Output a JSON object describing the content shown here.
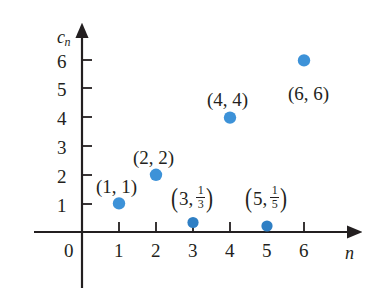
{
  "chart_data": {
    "type": "scatter",
    "title": "",
    "xlabel": "n",
    "ylabel": "c_n",
    "xlim": [
      0,
      6.6
    ],
    "ylim": [
      0,
      6.6
    ],
    "grid": false,
    "legend": null,
    "x": [
      1,
      2,
      3,
      4,
      5,
      6
    ],
    "y": [
      1,
      2,
      0.3333,
      4,
      0.2,
      6
    ],
    "point_labels": [
      "(1, 1)",
      "(2, 2)",
      "(3, 1/3)",
      "(4, 4)",
      "(5, 1/5)",
      "(6, 6)"
    ],
    "xticks": [
      0,
      1,
      2,
      3,
      4,
      5,
      6
    ],
    "yticks": [
      1,
      2,
      3,
      4,
      5,
      6
    ],
    "series": [
      {
        "name": "c_n",
        "points": [
          {
            "x": 1,
            "y": 1,
            "label": "(1, 1)",
            "kind": "plain"
          },
          {
            "x": 2,
            "y": 2,
            "label": "(2, 2)",
            "kind": "plain"
          },
          {
            "x": 3,
            "y": 0.3333,
            "label": "(3, 1/3)",
            "kind": "fraction",
            "whole": "3",
            "num": "1",
            "den": "3"
          },
          {
            "x": 4,
            "y": 4,
            "label": "(4, 4)",
            "kind": "plain"
          },
          {
            "x": 5,
            "y": 0.2,
            "label": "(5, 1/5)",
            "kind": "fraction",
            "whole": "5",
            "num": "1",
            "den": "5"
          },
          {
            "x": 6,
            "y": 6,
            "label": "(6, 6)",
            "kind": "plain"
          }
        ]
      }
    ]
  },
  "axes": {
    "y_label_base": "c",
    "y_label_sub": "n",
    "x_label": "n",
    "origin_label": "0",
    "y_ticks": [
      "6",
      "5",
      "4",
      "3",
      "2",
      "1"
    ],
    "x_ticks": [
      "1",
      "2",
      "3",
      "4",
      "5",
      "6"
    ]
  },
  "labels": {
    "p1": "(1, 1)",
    "p2": "(2, 2)",
    "p4": "(4, 4)",
    "p6": "(6, 6)",
    "p3_whole": "3,",
    "p3_num": "1",
    "p3_den": "3",
    "p5_whole": "5,",
    "p5_num": "1",
    "p5_den": "5",
    "open_paren": "(",
    "close_paren": ")"
  },
  "style": {
    "point_color": "#3d92d8",
    "axis_color": "#231f20",
    "background": "#ffffff"
  }
}
